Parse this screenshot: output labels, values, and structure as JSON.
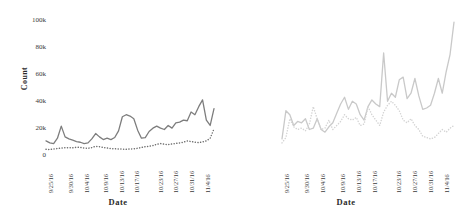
{
  "figure": {
    "title": "",
    "panel_count": 2
  },
  "chart_data": [
    {
      "type": "line",
      "panel": "left",
      "title": "",
      "xlabel": "Date",
      "ylabel": "Count",
      "ylim": [
        0,
        105000
      ],
      "yticks": [
        "0",
        "20k",
        "40k",
        "60k",
        "80k",
        "100k"
      ],
      "ytick_values": [
        0,
        20000,
        40000,
        60000,
        80000,
        100000
      ],
      "grid": false,
      "legend": "none",
      "xticklabels": [
        "9/25/16",
        "9/30/16",
        "10/4/16",
        "10/9/16",
        "10/13/16",
        "10/17/16",
        "10/23/16",
        "10/27/16",
        "10/31/16",
        "11/4/16"
      ],
      "xtick_positions": [
        0,
        5,
        9,
        14,
        18,
        22,
        28,
        32,
        36,
        40
      ],
      "x_count": 44,
      "series": [
        {
          "name": "solid",
          "style": "solid",
          "color": "#7d7d7d",
          "values": [
            10500,
            9000,
            8500,
            12500,
            21500,
            13500,
            12000,
            11000,
            10000,
            9500,
            8500,
            9000,
            12000,
            16000,
            13500,
            11500,
            12500,
            11500,
            13000,
            18000,
            28500,
            30000,
            29000,
            27000,
            18500,
            12500,
            13000,
            17500,
            20000,
            21500,
            20000,
            19000,
            22000,
            20000,
            24000,
            24500,
            26000,
            25500,
            32000,
            30000,
            36000,
            41000,
            26000,
            22000,
            34500
          ]
        },
        {
          "name": "dotted",
          "style": "dotted",
          "color": "#6e6e6e",
          "values": [
            4200,
            4000,
            4500,
            4800,
            5200,
            5400,
            5500,
            5300,
            5800,
            5600,
            5200,
            5000,
            5500,
            6500,
            6200,
            5600,
            5200,
            4800,
            4600,
            4500,
            4400,
            4200,
            4500,
            4600,
            5000,
            5600,
            6200,
            6500,
            7000,
            8000,
            8500,
            8000,
            7800,
            8200,
            8600,
            9000,
            9500,
            10500,
            10000,
            9500,
            9200,
            9800,
            10500,
            12500,
            19500
          ]
        }
      ]
    },
    {
      "type": "line",
      "panel": "right",
      "title": "",
      "xlabel": "Date",
      "ylabel": "",
      "ylim": [
        0,
        105000
      ],
      "grid": false,
      "legend": "none",
      "xticklabels": [
        "9/25/16",
        "9/30/16",
        "10/4/16",
        "10/9/16",
        "10/13/16",
        "10/17/16",
        "10/23/16",
        "10/27/16",
        "10/31/16",
        "11/4/16"
      ],
      "xtick_positions": [
        0,
        5,
        9,
        14,
        18,
        22,
        28,
        32,
        36,
        40
      ],
      "x_count": 44,
      "series": [
        {
          "name": "solid",
          "style": "solid",
          "color": "#c9c9c9",
          "values": [
            12000,
            33000,
            30000,
            22000,
            25000,
            24000,
            27000,
            19000,
            20000,
            27000,
            19000,
            17000,
            21000,
            24000,
            31000,
            38000,
            43000,
            34000,
            40000,
            38000,
            30000,
            26000,
            36000,
            41000,
            38000,
            36000,
            76000,
            40000,
            46000,
            43000,
            56000,
            58000,
            42000,
            46000,
            57000,
            44000,
            34000,
            35000,
            37000,
            46000,
            57000,
            46000,
            62000,
            75000,
            99000
          ]
        },
        {
          "name": "dotted",
          "style": "dotted",
          "color": "#d4d4d4",
          "values": [
            9000,
            13000,
            27000,
            21000,
            19000,
            20000,
            18000,
            23000,
            36000,
            27000,
            19000,
            20000,
            26000,
            19000,
            22000,
            25000,
            30000,
            27000,
            26000,
            28000,
            22000,
            23000,
            36000,
            30000,
            26000,
            22000,
            32000,
            37000,
            40000,
            37000,
            33000,
            26000,
            24000,
            27000,
            22000,
            19000,
            14000,
            13000,
            12000,
            13000,
            16000,
            19000,
            17000,
            20000,
            22000
          ]
        }
      ]
    }
  ]
}
